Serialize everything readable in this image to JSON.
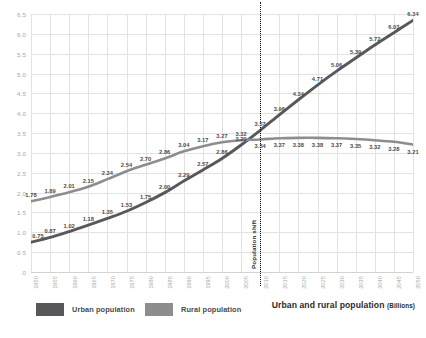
{
  "chart_data": {
    "type": "line",
    "title": "Urban and rural population",
    "title_units": "(Billions)",
    "xlabel": "",
    "ylabel": "",
    "ylim": [
      0,
      6.5
    ],
    "ytick_step": 0.5,
    "grid": true,
    "legend_position": "bottom-left",
    "categories": [
      "1950",
      "1955",
      "1960",
      "1965",
      "1970",
      "1975",
      "1980",
      "1985",
      "1990",
      "1995",
      "2000",
      "2005",
      "2010",
      "2015",
      "2020",
      "2025",
      "2030",
      "2035",
      "2040",
      "2045",
      "2050"
    ],
    "ytick_labels": [
      "0",
      "0.5",
      "1.0",
      "1.5",
      "2.0",
      "2.5",
      "3.0",
      "3.5",
      "4.0",
      "4.5",
      "5.0",
      "5.5",
      "6.0",
      "6.5"
    ],
    "series": [
      {
        "name": "Urban population",
        "color": "#58585a",
        "values": [
          0.75,
          0.87,
          1.02,
          1.18,
          1.35,
          1.53,
          1.75,
          2.0,
          2.29,
          2.57,
          2.86,
          3.2,
          3.57,
          3.96,
          4.34,
          4.71,
          5.06,
          5.39,
          5.72,
          6.03,
          6.34
        ],
        "labels": [
          "0.75",
          "0.87",
          "1.02",
          "1.18",
          "1.35",
          "1.53",
          "1.75",
          "2.00",
          "2.29",
          "2.57",
          "2.86",
          "3.20",
          "3.57",
          "3.96",
          "4.34",
          "4.71",
          "5.06",
          "5.39",
          "5.72",
          "6.03",
          "6.34"
        ]
      },
      {
        "name": "Rural population",
        "color": "#8d8d8f",
        "values": [
          1.78,
          1.89,
          2.01,
          2.15,
          2.34,
          2.54,
          2.7,
          2.86,
          3.04,
          3.17,
          3.27,
          3.32,
          3.34,
          3.37,
          3.38,
          3.38,
          3.37,
          3.35,
          3.32,
          3.28,
          3.21
        ],
        "labels": [
          "1.78",
          "1.89",
          "2.01",
          "2.15",
          "2.34",
          "2.54",
          "2.70",
          "2.86",
          "3.04",
          "3.17",
          "3.27",
          "3.32",
          "3.34",
          "3.37",
          "3.38",
          "3.38",
          "3.37",
          "3.35",
          "3.32",
          "3.28",
          "3.21"
        ]
      }
    ],
    "annotations": [
      {
        "name": "population-shift",
        "text": "Population shift",
        "at_category": "2010",
        "style": "vertical-dotted-line"
      }
    ]
  },
  "legend": {
    "items": [
      {
        "label": "Urban population",
        "color": "#58585a"
      },
      {
        "label": "Rural population",
        "color": "#8d8d8f"
      }
    ]
  }
}
